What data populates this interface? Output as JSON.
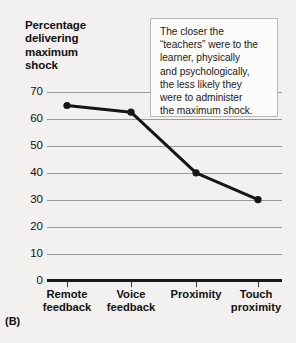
{
  "panel": {
    "label": "(B)"
  },
  "annotation": {
    "name": "callout-note",
    "lines": [
      "The closer the",
      "“teachers” were to the",
      "learner, physically",
      "and psychologically,",
      "the less likely they",
      "were to administer",
      "the maximum shock."
    ]
  },
  "axis_title_lines": [
    "Percentage",
    "delivering",
    "maximum",
    "shock"
  ],
  "colors": {
    "background": "#f2f1ef",
    "gridline": "#9d9b98",
    "axis": "#1a1a1a",
    "series": "#161616",
    "callout_border": "#b9b7b4",
    "callout_fill": "#fbfbfa"
  },
  "chart_data": {
    "type": "line",
    "title": "",
    "xlabel": "",
    "ylabel": "Percentage delivering maximum shock",
    "categories": [
      "Remote feedback",
      "Voice feedback",
      "Proximity",
      "Touch proximity"
    ],
    "category_lines": [
      [
        "Remote",
        "feedback"
      ],
      [
        "Voice",
        "feedback"
      ],
      [
        "Proximity",
        ""
      ],
      [
        "Touch",
        "proximity"
      ]
    ],
    "values": [
      65,
      62.5,
      40,
      30
    ],
    "ylim": [
      0,
      70
    ],
    "yticks": [
      0,
      10,
      20,
      30,
      40,
      50,
      60,
      70
    ],
    "grid": true,
    "legend": "none",
    "markers": true
  }
}
